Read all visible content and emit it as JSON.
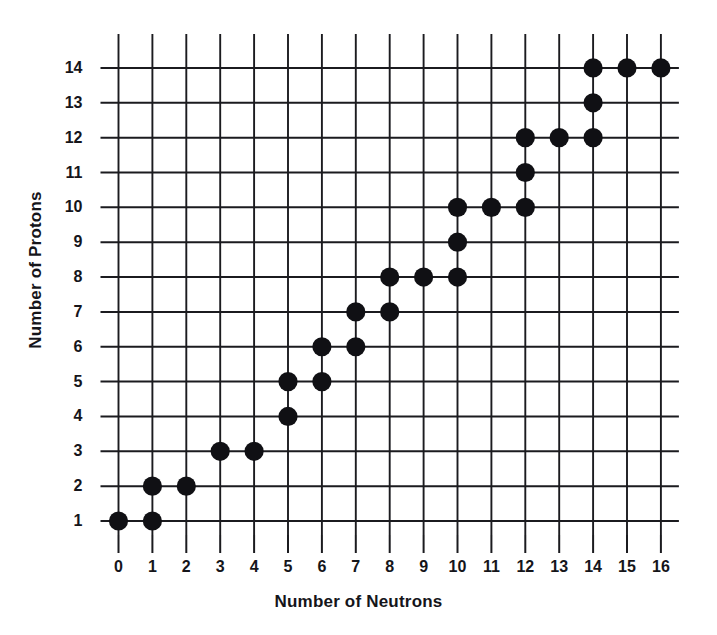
{
  "figure": {
    "x_axis_title": "Number of Neutrons",
    "y_axis_title": "Number of Protons",
    "x_ticks": [
      "0",
      "1",
      "2",
      "3",
      "4",
      "5",
      "6",
      "7",
      "8",
      "9",
      "10",
      "11",
      "12",
      "13",
      "14",
      "15",
      "16"
    ],
    "y_ticks": [
      "1",
      "2",
      "3",
      "4",
      "5",
      "6",
      "7",
      "8",
      "9",
      "10",
      "11",
      "12",
      "13",
      "14"
    ],
    "marker_color": "#101014",
    "grid_color": "#1b1b1f",
    "background_color": "#ffffff"
  },
  "chart_data": {
    "type": "scatter",
    "title": "",
    "xlabel": "Number of Neutrons",
    "ylabel": "Number of Protons",
    "xlim": [
      0,
      16
    ],
    "ylim": [
      1,
      14
    ],
    "xticks": [
      0,
      1,
      2,
      3,
      4,
      5,
      6,
      7,
      8,
      9,
      10,
      11,
      12,
      13,
      14,
      15,
      16
    ],
    "yticks": [
      1,
      2,
      3,
      4,
      5,
      6,
      7,
      8,
      9,
      10,
      11,
      12,
      13,
      14
    ],
    "grid": true,
    "legend": null,
    "series": [
      {
        "name": "Stable nuclides",
        "marker": "filled-circle",
        "color": "#101014",
        "points": [
          {
            "x": 0,
            "y": 1
          },
          {
            "x": 1,
            "y": 1
          },
          {
            "x": 1,
            "y": 2
          },
          {
            "x": 2,
            "y": 2
          },
          {
            "x": 3,
            "y": 3
          },
          {
            "x": 4,
            "y": 3
          },
          {
            "x": 5,
            "y": 4
          },
          {
            "x": 5,
            "y": 5
          },
          {
            "x": 6,
            "y": 5
          },
          {
            "x": 6,
            "y": 6
          },
          {
            "x": 7,
            "y": 6
          },
          {
            "x": 7,
            "y": 7
          },
          {
            "x": 8,
            "y": 7
          },
          {
            "x": 8,
            "y": 8
          },
          {
            "x": 9,
            "y": 8
          },
          {
            "x": 10,
            "y": 8
          },
          {
            "x": 10,
            "y": 9
          },
          {
            "x": 10,
            "y": 10
          },
          {
            "x": 11,
            "y": 10
          },
          {
            "x": 12,
            "y": 10
          },
          {
            "x": 12,
            "y": 11
          },
          {
            "x": 12,
            "y": 12
          },
          {
            "x": 13,
            "y": 12
          },
          {
            "x": 14,
            "y": 12
          },
          {
            "x": 14,
            "y": 13
          },
          {
            "x": 14,
            "y": 14
          },
          {
            "x": 15,
            "y": 14
          },
          {
            "x": 16,
            "y": 14
          }
        ]
      }
    ]
  }
}
